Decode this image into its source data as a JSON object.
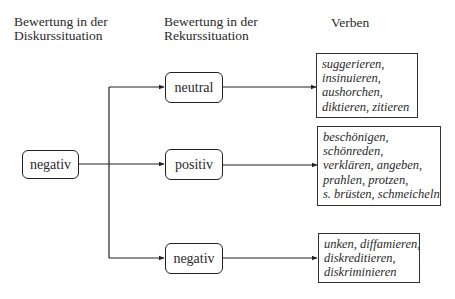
{
  "headers": {
    "col1": [
      "Bewertung in der",
      "Diskurssituation"
    ],
    "col2": [
      "Bewertung in der",
      "Rekurssituation"
    ],
    "col3": "Verben"
  },
  "source_node": {
    "label": "negativ"
  },
  "target_nodes": [
    {
      "label": "neutral"
    },
    {
      "label": "positiv"
    },
    {
      "label": "negativ"
    }
  ],
  "verb_groups": [
    {
      "lines": [
        "suggerieren,",
        "insinuieren,",
        "aushorchen,",
        "diktieren, zitieren"
      ]
    },
    {
      "lines": [
        "beschönigen,",
        "schönreden,",
        "verklären, angeben,",
        "prahlen, protzen,",
        "s. brüsten, schmeicheln"
      ]
    },
    {
      "lines": [
        "unken, diffamieren,",
        "diskreditieren,",
        "diskriminieren"
      ]
    }
  ],
  "colors": {
    "line": "#222222",
    "text": "#2a2a2a",
    "background": "#ffffff"
  }
}
